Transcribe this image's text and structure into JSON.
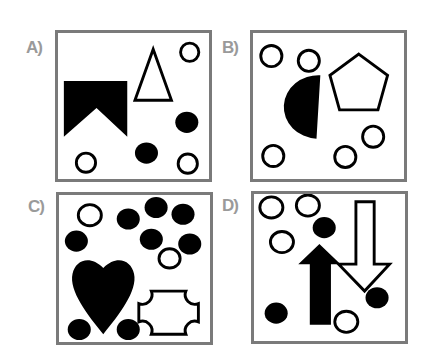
{
  "puzzle": {
    "options": [
      {
        "id": "A",
        "label": "A)",
        "contents": [
          "filled-notched-rectangle",
          "outline-triangle",
          "3 outline circles",
          "2 filled circles"
        ]
      },
      {
        "id": "B",
        "label": "B)",
        "contents": [
          "filled-half-circle",
          "outline-pentagon",
          "5 outline circles"
        ]
      },
      {
        "id": "C",
        "label": "C)",
        "contents": [
          "filled-heart",
          "outline-notched-square",
          "2 outline circles",
          "9 filled circles"
        ]
      },
      {
        "id": "D",
        "label": "D)",
        "contents": [
          "filled-up-arrow",
          "outline-down-arrow",
          "4 outline circles",
          "3 filled circles"
        ]
      }
    ]
  },
  "colors": {
    "stroke": "#000000",
    "border": "#7a7a7a",
    "label": "#9a9a9a",
    "background": "#ffffff"
  }
}
